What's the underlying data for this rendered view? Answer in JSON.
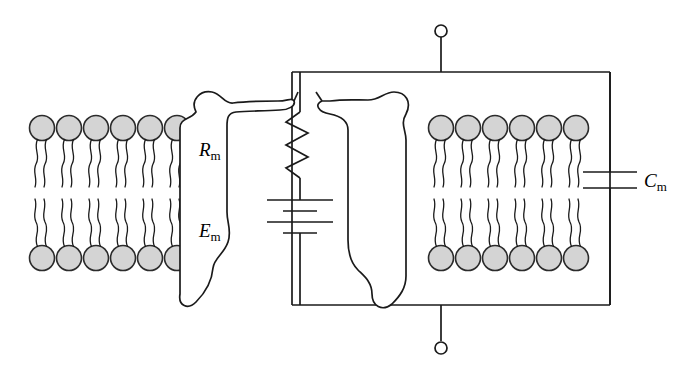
{
  "figure": {
    "background_color": "#ffffff",
    "stroke_color": "#1a1a1a",
    "width": 681,
    "height": 380
  },
  "labels": {
    "resistance": {
      "symbol": "R",
      "subscript": "m",
      "name": "membrane-resistance-label"
    },
    "emf": {
      "symbol": "E",
      "subscript": "m",
      "name": "membrane-emf-label"
    },
    "capacitance": {
      "symbol": "C",
      "subscript": "m",
      "name": "membrane-capacitance-label"
    }
  },
  "membrane": {
    "head_fill": "#d4d4d4",
    "head_stroke": "#2b2b2b",
    "leaflets": [
      {
        "id": "upper-left",
        "heads": 6,
        "tails_per_head": 2,
        "orientation": "heads-up"
      },
      {
        "id": "lower-left",
        "heads": 6,
        "tails_per_head": 2,
        "orientation": "heads-down"
      },
      {
        "id": "upper-right",
        "heads": 6,
        "tails_per_head": 2,
        "orientation": "heads-up"
      },
      {
        "id": "lower-right",
        "heads": 6,
        "tails_per_head": 2,
        "orientation": "heads-down"
      }
    ]
  },
  "proteins": [
    {
      "id": "channel-protein-left",
      "description": "transmembrane channel protein outline, left half of pore"
    },
    {
      "id": "channel-protein-right",
      "description": "transmembrane channel protein outline, right half of pore"
    }
  ],
  "circuit": {
    "elements": [
      {
        "type": "resistor",
        "label": "R",
        "sublabel": "m",
        "zigzags": 3,
        "orientation": "vertical",
        "name": "resistor-rm"
      },
      {
        "type": "battery",
        "label": "E",
        "sublabel": "m",
        "plates": 4,
        "orientation": "vertical",
        "name": "battery-em"
      },
      {
        "type": "capacitor",
        "label": "C",
        "sublabel": "m",
        "plates": 2,
        "orientation": "vertical",
        "name": "capacitor-cm"
      }
    ],
    "terminals": [
      {
        "id": "terminal-top",
        "shape": "open-circle",
        "position": "top"
      },
      {
        "id": "terminal-bottom",
        "shape": "open-circle",
        "position": "bottom"
      }
    ],
    "topology": "R_m in series with E_m; that branch in parallel with C_m; across two external terminals"
  }
}
